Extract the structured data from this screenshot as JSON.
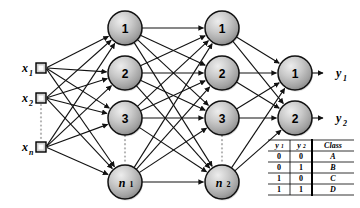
{
  "diagram": {
    "colors": {
      "node_fill_light": "#e2e2e2",
      "node_fill_dark": "#8d8d8d",
      "node_stroke": "#111111",
      "edge": "#111111",
      "dotted_guide": "#b5b5b5",
      "background": "#ffffff",
      "text": "#000000"
    },
    "input_layer": {
      "name": "input-layer",
      "nodes": [
        {
          "id": "x1",
          "base": "x",
          "sub": "1",
          "cx": 41,
          "cy": 68
        },
        {
          "id": "x2",
          "base": "x",
          "sub": "2",
          "cx": 41,
          "cy": 98
        },
        {
          "id": "xn",
          "base": "x",
          "sub": "n",
          "cx": 41,
          "cy": 147
        }
      ],
      "ellipsis_between": [
        "x2",
        "xn"
      ]
    },
    "hidden_layer_1": {
      "name": "hidden-layer-1",
      "nodes": [
        {
          "id": "h1-1",
          "label": "1",
          "italic": false,
          "sub": "",
          "cx": 125,
          "cy": 28,
          "r": 17
        },
        {
          "id": "h1-2",
          "label": "2",
          "italic": false,
          "sub": "",
          "cx": 125,
          "cy": 73,
          "r": 17
        },
        {
          "id": "h1-3",
          "label": "3",
          "italic": false,
          "sub": "",
          "cx": 125,
          "cy": 118,
          "r": 17
        },
        {
          "id": "h1-n",
          "label": "n",
          "italic": true,
          "sub": "1",
          "cx": 125,
          "cy": 182,
          "r": 17
        }
      ],
      "ellipsis_between": [
        "h1-3",
        "h1-n"
      ]
    },
    "hidden_layer_2": {
      "name": "hidden-layer-2",
      "nodes": [
        {
          "id": "h2-1",
          "label": "1",
          "italic": false,
          "sub": "",
          "cx": 222,
          "cy": 28,
          "r": 17
        },
        {
          "id": "h2-2",
          "label": "2",
          "italic": false,
          "sub": "",
          "cx": 222,
          "cy": 73,
          "r": 17
        },
        {
          "id": "h2-3",
          "label": "3",
          "italic": false,
          "sub": "",
          "cx": 222,
          "cy": 118,
          "r": 17
        },
        {
          "id": "h2-n",
          "label": "n",
          "italic": true,
          "sub": "2",
          "cx": 222,
          "cy": 182,
          "r": 17
        }
      ],
      "ellipsis_between": [
        "h2-3",
        "h2-n"
      ]
    },
    "output_layer": {
      "name": "output-layer",
      "nodes": [
        {
          "id": "o1",
          "label": "1",
          "cx": 295,
          "cy": 73,
          "r": 17
        },
        {
          "id": "o2",
          "label": "2",
          "cx": 295,
          "cy": 118,
          "r": 17
        }
      ],
      "labels": [
        {
          "id": "y1",
          "base": "y",
          "sub": "1",
          "x": 336,
          "y": 73
        },
        {
          "id": "y2",
          "base": "y",
          "sub": "2",
          "x": 336,
          "y": 118
        }
      ]
    },
    "truth_table": {
      "name": "class-truth-table",
      "x": 268,
      "y": 140,
      "width": 86,
      "row_height": 11,
      "headers": [
        {
          "base": "y",
          "sub": "1"
        },
        {
          "base": "y",
          "sub": "2"
        },
        {
          "base": "Class",
          "sub": ""
        }
      ],
      "rows": [
        [
          "0",
          "0",
          "A"
        ],
        [
          "0",
          "1",
          "B"
        ],
        [
          "1",
          "0",
          "C"
        ],
        [
          "1",
          "1",
          "D"
        ]
      ]
    }
  }
}
